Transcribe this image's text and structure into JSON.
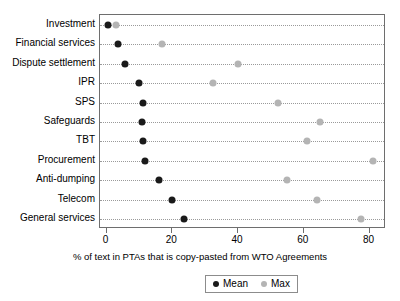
{
  "chart_data": {
    "type": "scatter",
    "title": "",
    "xlabel": "% of text in PTAs that is copy-pasted from WTO Agreements",
    "ylabel": "",
    "xlim": [
      -2,
      85
    ],
    "xticks": [
      0,
      20,
      40,
      60,
      80
    ],
    "xticklabels": [
      "0",
      "20",
      "40",
      "60",
      "80"
    ],
    "grid": "horizontal-dotted",
    "legend_position": "bottom-center",
    "categories": [
      "Investment",
      "Financial services",
      "Dispute settlement",
      "IPR",
      "SPS",
      "Safeguards",
      "TBT",
      "Procurement",
      "Anti-dumping",
      "Telecom",
      "General services"
    ],
    "series": [
      {
        "name": "Mean",
        "color": "#1a1a1a",
        "marker": "circle",
        "values": [
          0.3,
          3.5,
          5.5,
          10.0,
          11.0,
          10.8,
          11.0,
          11.6,
          16.0,
          20.0,
          23.5
        ]
      },
      {
        "name": "Max",
        "color": "#b4b4b4",
        "marker": "diamond",
        "values": [
          3.0,
          17.0,
          40.0,
          32.5,
          52.0,
          65.0,
          61.0,
          81.0,
          55.0,
          64.0,
          77.5
        ]
      }
    ],
    "legend": [
      "Mean",
      "Max"
    ]
  }
}
